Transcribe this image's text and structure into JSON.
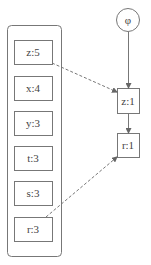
{
  "diagram": {
    "root_node": {
      "label": "φ"
    },
    "group_items": [
      {
        "label": "z:5"
      },
      {
        "label": "x:4"
      },
      {
        "label": "y:3"
      },
      {
        "label": "t:3"
      },
      {
        "label": "s:3"
      },
      {
        "label": "r:3"
      }
    ],
    "chain_nodes": [
      {
        "label": "z:1"
      },
      {
        "label": "r:1"
      }
    ],
    "edges": [
      {
        "from": "φ",
        "to": "z:1",
        "style": "solid"
      },
      {
        "from": "z:1",
        "to": "r:1",
        "style": "solid"
      },
      {
        "from": "z:5",
        "to": "z:1",
        "style": "dashed"
      },
      {
        "from": "r:3",
        "to": "r:1",
        "style": "dashed"
      }
    ],
    "colors": {
      "stroke": "#666666",
      "text": "#444444"
    }
  }
}
